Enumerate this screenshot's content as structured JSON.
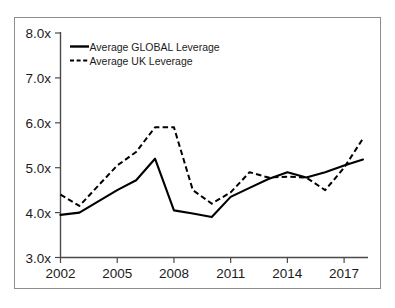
{
  "chart_data": {
    "type": "line",
    "title": "",
    "xlabel": "",
    "ylabel": "",
    "xlim": [
      2002,
      2018
    ],
    "ylim": [
      3.0,
      8.0
    ],
    "grid": false,
    "legend_position": "top-left",
    "x": [
      2002,
      2003,
      2004,
      2005,
      2006,
      2007,
      2008,
      2009,
      2010,
      2011,
      2012,
      2013,
      2014,
      2015,
      2016,
      2017,
      2018
    ],
    "y_tick_labels": [
      "3.0x",
      "4.0x",
      "5.0x",
      "6.0x",
      "7.0x",
      "8.0x"
    ],
    "y_tick_values": [
      3.0,
      4.0,
      5.0,
      6.0,
      7.0,
      8.0
    ],
    "x_tick_labels": [
      "2002",
      "2005",
      "2008",
      "2011",
      "2014",
      "2017"
    ],
    "x_tick_values": [
      2002,
      2005,
      2008,
      2011,
      2014,
      2017
    ],
    "series": [
      {
        "name": "Average GLOBAL Leverage",
        "style": "solid",
        "color": "#000000",
        "values": [
          3.95,
          4.0,
          4.25,
          4.5,
          4.72,
          5.2,
          4.05,
          3.98,
          3.9,
          4.35,
          4.55,
          4.75,
          4.9,
          4.78,
          4.9,
          5.05,
          5.18
        ]
      },
      {
        "name": "Average UK Leverage",
        "style": "dashed",
        "color": "#000000",
        "values": [
          4.4,
          4.15,
          4.6,
          5.05,
          5.35,
          5.9,
          5.9,
          4.5,
          4.2,
          4.45,
          4.9,
          4.78,
          4.8,
          4.78,
          4.5,
          5.0,
          5.65
        ]
      }
    ]
  },
  "legend": {
    "entries": [
      {
        "label": "Average GLOBAL Leverage",
        "style": "solid"
      },
      {
        "label": "Average UK Leverage",
        "style": "dashed"
      }
    ]
  }
}
